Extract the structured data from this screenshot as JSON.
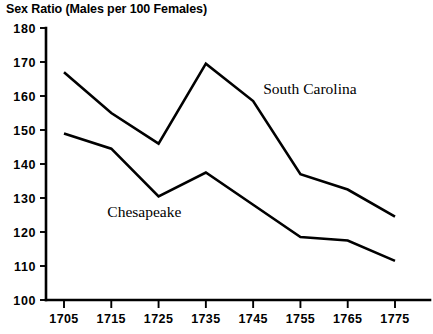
{
  "chart_data": {
    "type": "line",
    "title": "Sex Ratio (Males per 100 Females)",
    "xlabel": "",
    "ylabel": "",
    "x": [
      1705,
      1715,
      1725,
      1735,
      1745,
      1755,
      1765,
      1775
    ],
    "categories": [
      "1705",
      "1715",
      "1725",
      "1735",
      "1745",
      "1755",
      "1765",
      "1775"
    ],
    "xlim": [
      1705,
      1775
    ],
    "ylim": [
      100,
      180
    ],
    "yticks": [
      100,
      110,
      120,
      130,
      140,
      150,
      160,
      170,
      180
    ],
    "ytick_labels": [
      "100",
      "110",
      "120",
      "130",
      "140",
      "150",
      "160",
      "170",
      "180"
    ],
    "grid": false,
    "legend_position": "inline-annotation",
    "series": [
      {
        "name": "South Carolina",
        "values": [
          167,
          155,
          146,
          169.5,
          158.5,
          137,
          132.5,
          124.5
        ],
        "color": "#000000",
        "label_x": 1757,
        "label_y": 160.5
      },
      {
        "name": "Chesapeake",
        "values": [
          149,
          144.5,
          130.5,
          137.5,
          128,
          118.5,
          117.5,
          111.5
        ],
        "color": "#000000",
        "label_x": 1722,
        "label_y": 124.5
      }
    ],
    "annotations": [
      {
        "text": "South Carolina",
        "series": "South Carolina"
      },
      {
        "text": "Chesapeake",
        "series": "Chesapeake"
      }
    ]
  },
  "colors": {
    "background": "#ffffff",
    "ink": "#000000"
  }
}
